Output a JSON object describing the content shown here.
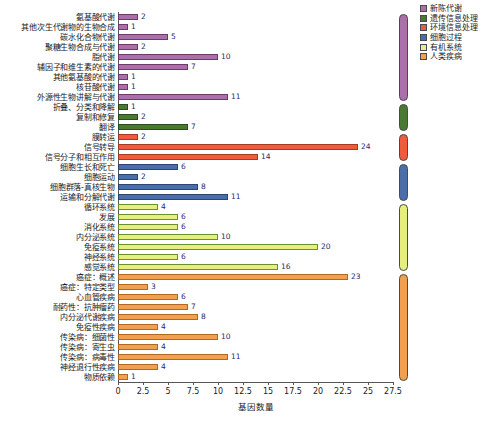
{
  "chart_data": {
    "type": "bar",
    "orientation": "horizontal",
    "title": "",
    "xlabel": "基因数量",
    "ylabel": "",
    "xlim": [
      0,
      27.5
    ],
    "xticks": [
      "0",
      "2.5",
      "5",
      "7.5",
      "10",
      "12.5",
      "15",
      "17.5",
      "20",
      "22.5",
      "25",
      "27.5"
    ],
    "xtick_values": [
      0,
      2.5,
      5,
      7.5,
      10,
      12.5,
      15,
      17.5,
      20,
      22.5,
      25,
      27.5
    ],
    "grid": false,
    "legend_position": "top-right",
    "categories": [
      "氨基酸代谢",
      "其他次生代谢物的生物合成",
      "碳水化合物代谢",
      "聚糖生物合成与代谢",
      "脂代谢",
      "辅因子和维生素的代谢",
      "其他氨基酸的代谢",
      "核苷酸代谢",
      "外源性生物讲解与代谢",
      "折叠、分类和降解",
      "复制和修复",
      "翻译",
      "膜转运",
      "信号转导",
      "信号分子和相互作用",
      "细胞生长和死亡",
      "细胞运动",
      "细胞群落-真核生物",
      "运输和分解代谢",
      "循环系统",
      "发展",
      "消化系统",
      "内分泌系统",
      "免疫系统",
      "神经系统",
      "感觉系统",
      "癌症：概述",
      "癌症：特定类型",
      "心血管疾病",
      "耐药性：抗肿瘤药",
      "内分泌代谢疾病",
      "免疫性疾病",
      "传染病：细菌性",
      "传染病：寄生虫",
      "传染病：病毒性",
      "神经退行性疾病",
      "物质依赖"
    ],
    "values": [
      2,
      1,
      5,
      2,
      10,
      7,
      1,
      1,
      11,
      1,
      2,
      7,
      2,
      24,
      14,
      6,
      2,
      8,
      11,
      4,
      6,
      6,
      10,
      20,
      6,
      16,
      23,
      3,
      6,
      7,
      8,
      4,
      10,
      4,
      11,
      4,
      1
    ],
    "group_of_bar": [
      "metabolism",
      "metabolism",
      "metabolism",
      "metabolism",
      "metabolism",
      "metabolism",
      "metabolism",
      "metabolism",
      "metabolism",
      "genetic",
      "genetic",
      "genetic",
      "environmental",
      "environmental",
      "environmental",
      "cellular",
      "cellular",
      "cellular",
      "cellular",
      "organismal",
      "organismal",
      "organismal",
      "organismal",
      "organismal",
      "organismal",
      "organismal",
      "disease",
      "disease",
      "disease",
      "disease",
      "disease",
      "disease",
      "disease",
      "disease",
      "disease",
      "disease",
      "disease"
    ],
    "groups": [
      {
        "key": "metabolism",
        "label": "新陈代谢",
        "color": "#ab6faa",
        "count": 9
      },
      {
        "key": "genetic",
        "label": "遗传信息处理",
        "color": "#4a7a32",
        "count": 3
      },
      {
        "key": "environmental",
        "label": "环境信息处理",
        "color": "#ef5b3c",
        "count": 3
      },
      {
        "key": "cellular",
        "label": "细胞过程",
        "color": "#4a6ea9",
        "count": 4
      },
      {
        "key": "organismal",
        "label": "有机系统",
        "color": "#e6ee80",
        "count": 7
      },
      {
        "key": "disease",
        "label": "人类疾病",
        "color": "#f0a050",
        "count": 11
      }
    ]
  },
  "legend": {
    "items": [
      {
        "label": "新陈代谢",
        "color": "#ab6faa"
      },
      {
        "label": "遗传信息处理",
        "color": "#4a7a32"
      },
      {
        "label": "环境信息处理",
        "color": "#ef5b3c"
      },
      {
        "label": "细胞过程",
        "color": "#4a6ea9"
      },
      {
        "label": "有机系统",
        "color": "#e6ee80"
      },
      {
        "label": "人类疾病",
        "color": "#f0a050"
      }
    ]
  }
}
